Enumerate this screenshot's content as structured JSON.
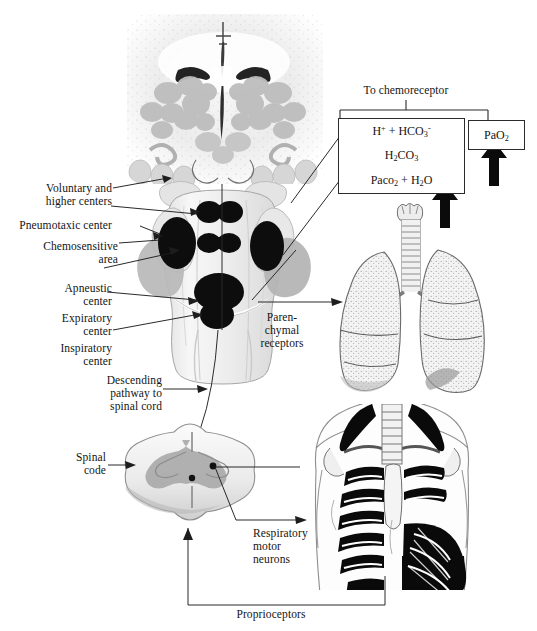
{
  "figure": {
    "title_text": "To chemoreceptor",
    "background": "#ffffff",
    "ink": "#141414"
  },
  "chem_boxes": {
    "header": "To chemoreceptor",
    "rows": [
      {
        "name": "bicarbonate-row",
        "html": "H<sup>+</sup> + HCO<sub>3</sub><sup>-</sup>",
        "plain": "H+ + HCO3-"
      },
      {
        "name": "carbonic-acid-row",
        "html": "H<sub>2</sub>CO<sub>3</sub>",
        "plain": "H2CO3"
      },
      {
        "name": "paco2-water-row",
        "html": "Paco<sub>2</sub> + H<sub>2</sub>O",
        "plain": "Paco2 + H2O"
      }
    ],
    "pao2": {
      "name": "pao2-box",
      "html": "PaO<sub>2</sub>",
      "plain": "PaO2"
    }
  },
  "labels": {
    "voluntary": "Voluntary and\nhigher centers",
    "pneumotaxic": "Pneumotaxic center",
    "chemosensitive": "Chemosensitive\narea",
    "apneustic": "Apneustic\ncenter",
    "expiratory": "Expiratory\ncenter",
    "inspiratory": "Inspiratory\ncenter",
    "descending": "Descending\npathway to\nspinal cord",
    "spinal_code": "Spinal\ncode",
    "parenchymal": "Paren-\nchymal\nreceptors",
    "respiratory_motor": "Respiratory\nmotor\nneurons",
    "proprioceptors": "Proprioceptors"
  },
  "anatomy": {
    "brainstem_section": "pons-medulla-cross-section",
    "brainstem_posterior": "brainstem-posterior-view",
    "spinal_cord": "spinal-cord-cross-section",
    "lungs": "lungs-and-trachea",
    "thorax": "thorax-ribcage-intercostal-muscles"
  },
  "arrows": {
    "up_pao2": "increase-arrow",
    "up_paco2": "increase-arrow"
  }
}
